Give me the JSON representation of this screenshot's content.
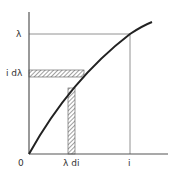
{
  "diagram": {
    "type": "function curve with hatched area strips",
    "axes": {
      "x_origin_label": "0",
      "x_tick_label": "i",
      "x_strip_label": "λ di",
      "y_tick_label": "λ",
      "y_strip_label": "i dλ"
    },
    "colors": {
      "curve": "#222222",
      "axes": "#555555",
      "guides": "#777777",
      "hatch": "#444444",
      "background": "#ffffff"
    }
  }
}
